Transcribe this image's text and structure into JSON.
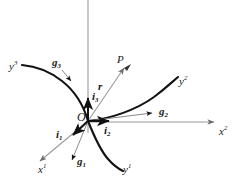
{
  "figure": {
    "kind": "geometry-diagram",
    "width": 236,
    "height": 184,
    "background_color": "#ffffff",
    "axis_color": "#8c8c8c",
    "curve_color": "#111111",
    "vector_color": "#8c8c8c",
    "unit_vector_color": "#111111",
    "label_color": "#1a1a1a"
  },
  "origin": {
    "label": "O",
    "x": 88,
    "y": 121,
    "label_x": 77,
    "label_y": 112
  },
  "point": {
    "label": "P",
    "x": 127,
    "y": 65,
    "label_x": 117,
    "label_y": 55
  },
  "cartesian_axes": [
    {
      "id": "x3",
      "base": "x",
      "superscript": "3",
      "label_x": 0,
      "label_y": 0,
      "label_visible": false,
      "direction": "up",
      "tip_x": 88,
      "tip_y": 0,
      "arrow": false
    },
    {
      "id": "x2",
      "base": "x",
      "superscript": "2",
      "label_x": 219,
      "label_y": 127,
      "label_visible": true,
      "direction": "right",
      "tip_x": 219,
      "tip_y": 122,
      "arrow": true
    },
    {
      "id": "x1",
      "base": "x",
      "superscript": "1",
      "label_x": 39,
      "label_y": 165,
      "label_visible": true,
      "direction": "lower-left",
      "tip_x": 36,
      "tip_y": 164,
      "arrow": true
    }
  ],
  "unit_vectors": [
    {
      "id": "i3",
      "base": "i",
      "subscript": "3",
      "label_x": 92,
      "label_y": 92,
      "tip_x": 88,
      "tip_y": 94,
      "direction": "up"
    },
    {
      "id": "i1",
      "base": "i",
      "subscript": "1",
      "label_x": 58,
      "label_y": 130,
      "tip_x": 70,
      "tip_y": 138,
      "direction": "lower-left"
    },
    {
      "id": "i2",
      "base": "i",
      "subscript": "2",
      "label_x": 105,
      "label_y": 126,
      "tip_x": 113,
      "tip_y": 122,
      "direction": "right"
    }
  ],
  "base_vectors": [
    {
      "id": "g3",
      "base": "g",
      "subscript": "3",
      "label_x": 53,
      "label_y": 58,
      "tip_x": 72,
      "tip_y": 83,
      "direction": "upper-left"
    },
    {
      "id": "g2",
      "base": "g",
      "subscript": "2",
      "label_x": 160,
      "label_y": 107,
      "tip_x": 156,
      "tip_y": 113,
      "direction": "right-up"
    },
    {
      "id": "g1",
      "base": "g",
      "subscript": "1",
      "label_x": 78,
      "label_y": 157,
      "tip_x": 72,
      "tip_y": 164,
      "direction": "down"
    }
  ],
  "position_vector": {
    "id": "r",
    "base": "r",
    "label_x": 99,
    "label_y": 82,
    "from_x": 88,
    "from_y": 121,
    "to_x": 127,
    "to_y": 65
  },
  "coordinate_curves": [
    {
      "id": "y3",
      "base": "y",
      "superscript": "3",
      "label_x": 10,
      "label_y": 62,
      "description": "curve through origin bending to upper-left"
    },
    {
      "id": "y2",
      "base": "y",
      "superscript": "2",
      "label_x": 180,
      "label_y": 77,
      "description": "curve through origin bending to upper-right"
    },
    {
      "id": "y1",
      "base": "y",
      "superscript": "1",
      "label_x": 124,
      "label_y": 165,
      "description": "curve through origin bending to lower-right"
    }
  ]
}
